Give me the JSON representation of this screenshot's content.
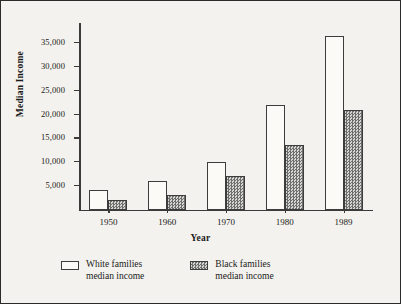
{
  "chart_data": {
    "type": "bar",
    "title": "",
    "xlabel": "Year",
    "ylabel": "Median Income",
    "categories": [
      "1950",
      "1960",
      "1970",
      "1980",
      "1989"
    ],
    "series": [
      {
        "name": "White families median income",
        "name_line1": "White families",
        "name_line2": "median income",
        "values": [
          4000,
          6000,
          10000,
          22000,
          36300
        ],
        "fill": "white",
        "color": "#fbfaf7"
      },
      {
        "name": "Black families median income",
        "name_line1": "Black families",
        "name_line2": "median income",
        "values": [
          2000,
          3000,
          7000,
          13500,
          20800
        ],
        "fill": "checkered",
        "color": "#9a9a98"
      }
    ],
    "ylim": [
      0,
      39000
    ],
    "yticks": [
      5000,
      10000,
      15000,
      20000,
      25000,
      30000,
      35000
    ],
    "ytick_labels": [
      "5,000",
      "10,000",
      "15,000",
      "20,000",
      "25,000",
      "30,000",
      "35,000"
    ],
    "grid": false,
    "legend_position": "bottom"
  },
  "figure": {
    "background": "#f4f2ee",
    "border_color": "#2b2b2b",
    "axis_color": "#3a3a3a"
  }
}
